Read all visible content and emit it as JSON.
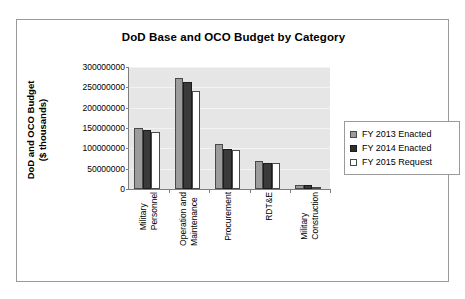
{
  "chart_data": {
    "type": "bar",
    "title": "DoD Base and OCO Budget by Category",
    "xlabel": "",
    "ylabel": "DoD and OCO Budget ($ thousands)",
    "ylabel_line1": "DoD and OCO Budget",
    "ylabel_line2": "($ thousands)",
    "ylim": [
      0,
      300000000
    ],
    "ytick_values": [
      0,
      50000000,
      100000000,
      150000000,
      200000000,
      250000000,
      300000000
    ],
    "ytick_labels": [
      "0",
      "50000000",
      "100000000",
      "150000000",
      "200000000",
      "250000000",
      "300000000"
    ],
    "grid": true,
    "legend_position": "right",
    "categories": [
      "Military Personnel",
      "Operation and Maintenance",
      "Procurement",
      "RDT&E",
      "Military Construction"
    ],
    "category_lines": [
      [
        "Military",
        "Personnel"
      ],
      [
        "Operation and",
        "Maintenance"
      ],
      [
        "Procurement",
        ""
      ],
      [
        "RDT&E",
        ""
      ],
      [
        "Military",
        "Construction"
      ]
    ],
    "series": [
      {
        "name": "FY 2013 Enacted",
        "color": "#9c9c9c",
        "values": [
          149000000,
          274000000,
          110000000,
          70000000,
          10000000
        ]
      },
      {
        "name": "FY 2014 Enacted",
        "color": "#3a3a3a",
        "values": [
          145000000,
          264000000,
          99000000,
          63000000,
          9000000
        ]
      },
      {
        "name": "FY 2015 Request",
        "color": "#ffffff",
        "values": [
          141000000,
          242000000,
          97000000,
          64000000,
          6000000
        ]
      }
    ]
  },
  "legend": {
    "items": [
      {
        "label": "FY 2013 Enacted"
      },
      {
        "label": "FY 2014 Enacted"
      },
      {
        "label": "FY 2015 Request"
      }
    ]
  }
}
